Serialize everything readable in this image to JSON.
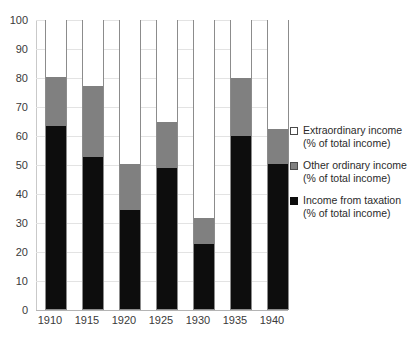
{
  "chart_data": {
    "type": "bar",
    "stacked": true,
    "title": "",
    "subtitle": "",
    "xlabel": "",
    "ylabel": "",
    "categories": [
      "1910",
      "1915",
      "1920",
      "1925",
      "1930",
      "1935",
      "1940"
    ],
    "ylim": [
      0,
      100
    ],
    "ytick_labels": [
      "0",
      "10",
      "20",
      "30",
      "40",
      "50",
      "60",
      "70",
      "80",
      "90",
      "100"
    ],
    "ytick_values": [
      0,
      10,
      20,
      30,
      40,
      50,
      60,
      70,
      80,
      90,
      100
    ],
    "grid": true,
    "grid_axis": "y",
    "legend_position": "right",
    "series": [
      {
        "name": "Income from taxation (% of total income)",
        "label_line1": "Income from taxation",
        "label_line2": "(% of total income)",
        "color": "#0d0d0d",
        "values": [
          63,
          52.5,
          34,
          48.5,
          22.5,
          59.5,
          50
        ]
      },
      {
        "name": "Other ordinary income (% of total income)",
        "label_line1": "Other ordinary income",
        "label_line2": "(% of total income)",
        "color": "#808080",
        "values": [
          17,
          24.5,
          16,
          16,
          9,
          20,
          12
        ]
      },
      {
        "name": "Extraordinary income (% of total income)",
        "label_line1": "Extraordinary income",
        "label_line2": "(% of total income)",
        "color": "#ffffff",
        "values": [
          20,
          23,
          50,
          35.5,
          68.5,
          20.5,
          38
        ]
      }
    ],
    "cumulative_tops": {
      "taxation": [
        63,
        52.5,
        34,
        48.5,
        22.5,
        59.5,
        50
      ],
      "other": [
        80,
        77,
        50,
        64.5,
        31.5,
        79.5,
        62
      ],
      "extraordinary": [
        100,
        100,
        100,
        100,
        100,
        100,
        100
      ]
    }
  },
  "legend": {
    "items": [
      {
        "marker": "square-outline-icon",
        "line1": "Extraordinary income",
        "line2": "(% of total income)"
      },
      {
        "marker": "square-gray-icon",
        "line1": "Other ordinary income",
        "line2": "(% of total income)"
      },
      {
        "marker": "square-black-icon",
        "line1": "Income from taxation",
        "line2": "(% of total income)"
      }
    ]
  }
}
